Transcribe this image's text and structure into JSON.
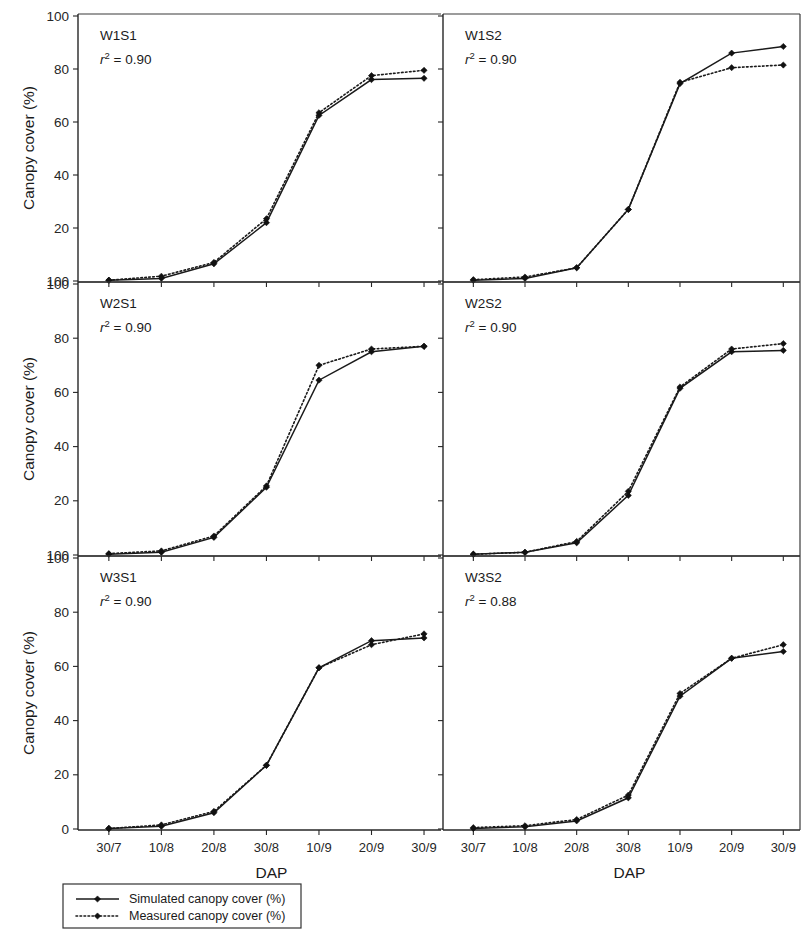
{
  "figure": {
    "axis_titles": {
      "y": "Canopy cover (%)",
      "x": "DAP"
    },
    "y_ticks": [
      "0",
      "20",
      "40",
      "60",
      "80",
      "100"
    ],
    "y_ticks_shared_boundary": "100",
    "y_tick_bottom_last_panel": "0",
    "x_ticks": [
      "30/7",
      "10/8",
      "20/8",
      "30/8",
      "10/9",
      "20/9",
      "30/9"
    ],
    "legend": {
      "items": [
        {
          "label": "Simulated canopy cover (%)",
          "style": "solid-line-diamond"
        },
        {
          "label": "Measured canopy cover (%)",
          "style": "dotted-line-diamond"
        }
      ]
    }
  },
  "chart_data": {
    "type": "line",
    "title": "",
    "xlabel": "DAP",
    "ylabel": "Canopy cover (%)",
    "x": [
      "30/7",
      "10/8",
      "20/8",
      "30/8",
      "10/9",
      "20/9",
      "30/9"
    ],
    "ylim": [
      0,
      100
    ],
    "yticks": [
      0,
      20,
      40,
      60,
      80,
      100
    ],
    "grid": false,
    "legend_position": "below-axes-left",
    "panels": [
      {
        "name": "W1S1",
        "r2_label": "r",
        "r2_sup": "2",
        "r2_value": " = 0.90",
        "r2_text": "r2 = 0.90",
        "row": 0,
        "col": 0,
        "series": [
          {
            "name": "Simulated canopy cover (%)",
            "values": [
              0.3,
              1.0,
              6.5,
              22.0,
              62.5,
              76.0,
              76.5
            ]
          },
          {
            "name": "Measured canopy cover (%)",
            "values": [
              0.3,
              1.8,
              7.0,
              23.5,
              63.5,
              77.5,
              79.5
            ]
          }
        ]
      },
      {
        "name": "W1S2",
        "r2_label": "r",
        "r2_sup": "2",
        "r2_value": " = 0.90",
        "r2_text": "r2 = 0.90",
        "row": 0,
        "col": 1,
        "series": [
          {
            "name": "Simulated canopy cover (%)",
            "values": [
              0.3,
              1.0,
              5.0,
              27.0,
              74.5,
              86.0,
              88.5
            ]
          },
          {
            "name": "Measured canopy cover (%)",
            "values": [
              0.5,
              1.5,
              5.0,
              27.0,
              75.0,
              80.5,
              81.5
            ]
          }
        ]
      },
      {
        "name": "W2S1",
        "r2_label": "r",
        "r2_sup": "2",
        "r2_value": " = 0.90",
        "r2_text": "r2 = 0.90",
        "row": 1,
        "col": 0,
        "series": [
          {
            "name": "Simulated canopy cover (%)",
            "values": [
              0.3,
              1.0,
              6.5,
              25.0,
              64.5,
              75.0,
              77.0
            ]
          },
          {
            "name": "Measured canopy cover (%)",
            "values": [
              0.5,
              1.5,
              7.0,
              25.5,
              70.0,
              76.0,
              77.0
            ]
          }
        ]
      },
      {
        "name": "W2S2",
        "r2_label": "r",
        "r2_sup": "2",
        "r2_value": " = 0.90",
        "r2_text": "r2 = 0.90",
        "row": 1,
        "col": 1,
        "series": [
          {
            "name": "Simulated canopy cover (%)",
            "values": [
              0.3,
              1.0,
              4.5,
              22.0,
              61.5,
              75.0,
              75.5
            ]
          },
          {
            "name": "Measured canopy cover (%)",
            "values": [
              0.3,
              1.0,
              5.0,
              23.5,
              62.0,
              76.0,
              78.0
            ]
          }
        ]
      },
      {
        "name": "W3S1",
        "r2_label": "r",
        "r2_sup": "2",
        "r2_value": " = 0.90",
        "r2_text": "r2 = 0.90",
        "row": 2,
        "col": 0,
        "series": [
          {
            "name": "Simulated canopy cover (%)",
            "values": [
              0.2,
              1.0,
              6.0,
              23.5,
              59.5,
              69.5,
              70.5
            ]
          },
          {
            "name": "Measured canopy cover (%)",
            "values": [
              0.2,
              1.5,
              6.5,
              23.5,
              59.5,
              68.0,
              72.0
            ]
          }
        ]
      },
      {
        "name": "W3S2",
        "r2_label": "r",
        "r2_sup": "2",
        "r2_value": " = 0.88",
        "r2_text": "r2 = 0.88",
        "row": 2,
        "col": 1,
        "series": [
          {
            "name": "Simulated canopy cover (%)",
            "values": [
              0.2,
              0.8,
              3.0,
              11.5,
              49.0,
              63.0,
              65.5
            ]
          },
          {
            "name": "Measured canopy cover (%)",
            "values": [
              0.5,
              1.2,
              3.5,
              12.5,
              50.0,
              63.0,
              68.0
            ]
          }
        ]
      }
    ]
  }
}
